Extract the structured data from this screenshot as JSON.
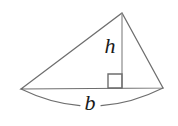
{
  "figure": {
    "name": "triangle-area-diagram",
    "type": "geometry-diagram",
    "background_color": "#ffffff",
    "stroke_color": "#6e6e6e",
    "height_line_color": "#8a8a8a",
    "label_color": "#1a1a1a",
    "stroke_width": 1.2
  },
  "labels": {
    "height": "h",
    "base": "b"
  },
  "geometry": {
    "apex": {
      "x": 122,
      "y": 13
    },
    "left_vertex": {
      "x": 21,
      "y": 89
    },
    "right_vertex": {
      "x": 163,
      "y": 88
    },
    "height_foot": {
      "x": 122,
      "y": 88
    },
    "right_angle_marker": {
      "x": 108,
      "y": 74,
      "size": 14
    },
    "base_brace": {
      "start_x": 21,
      "start_y": 89,
      "end_x": 163,
      "end_y": 88,
      "dip_y": 106,
      "gap_left_x": 80,
      "gap_right_x": 101
    },
    "height_label_position": {
      "x": 110,
      "y": 48
    },
    "base_label_position": {
      "x": 90,
      "y": 105
    }
  },
  "typography": {
    "height_label_size": 22,
    "base_label_size": 22
  }
}
